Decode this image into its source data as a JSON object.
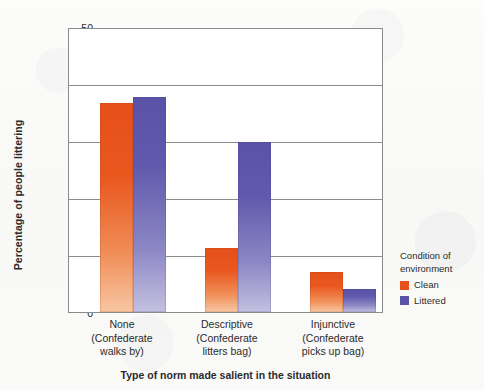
{
  "chart_data": {
    "type": "bar",
    "title": "",
    "subtitle": "",
    "xlabel": "Type of norm made salient in the situation",
    "ylabel": "Percentage of people littering",
    "ylim": [
      0,
      50
    ],
    "yticks": [
      0,
      10,
      20,
      30,
      40,
      50
    ],
    "ytick_labels": [
      "0",
      "10",
      "20",
      "30",
      "40",
      "50"
    ],
    "grid": "horizontal",
    "legend_position": "right",
    "legend_title": "Condition of environment",
    "categories": [
      "None\n(Confederate\nwalks by)",
      "Descriptive\n(Confederate\nlitters bag)",
      "Injunctive\n(Confederate\npicks up bag)"
    ],
    "category_lines": [
      [
        "None",
        "(Confederate",
        "walks by)"
      ],
      [
        "Descriptive",
        "(Confederate",
        "litters bag)"
      ],
      [
        "Injunctive",
        "(Confederate",
        "picks up bag)"
      ]
    ],
    "series": [
      {
        "name": "Clean",
        "color": "#e8521a",
        "values": [
          37,
          11.3,
          7
        ]
      },
      {
        "name": "Littered",
        "color": "#5a52a7",
        "values": [
          38,
          30,
          4
        ]
      }
    ]
  },
  "axis": {
    "y_label": "Percentage of people littering",
    "x_label": "Type of norm made salient in the situation",
    "y_ticks": [
      "50",
      "40",
      "30",
      "20",
      "10",
      "0"
    ]
  },
  "legend": {
    "title_line1": "Condition of",
    "title_line2": "environment",
    "items": [
      {
        "label": "Clean",
        "color": "#e8521a"
      },
      {
        "label": "Littered",
        "color": "#5a52a7"
      }
    ]
  }
}
